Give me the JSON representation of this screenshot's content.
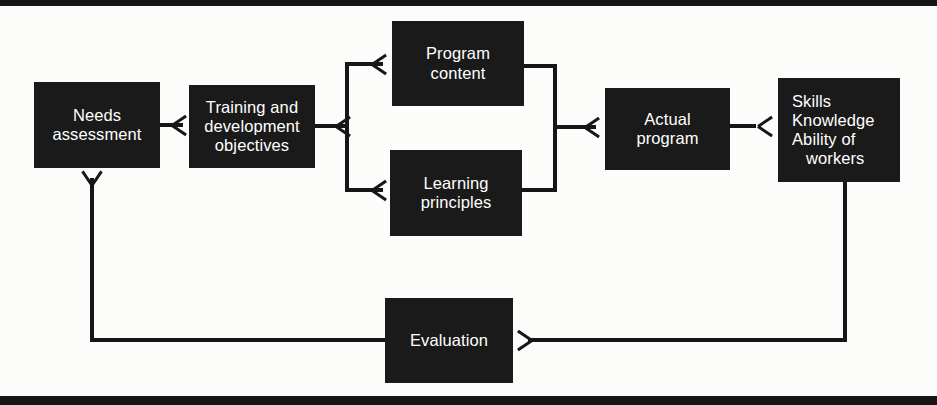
{
  "figure": {
    "background_color": "#fcfcfb",
    "node_fill_color": "#1a1a1a",
    "node_text_color": "#ffffff",
    "connector_color": "#161616"
  },
  "rules": {
    "top_label": "top-rule",
    "bottom_label": "bottom-rule"
  },
  "nodes": {
    "needs_assessment": {
      "lines": [
        "Needs",
        "assessment"
      ]
    },
    "training_objectives": {
      "lines": [
        "Training and",
        "development",
        "objectives"
      ]
    },
    "program_content": {
      "lines": [
        "Program",
        "content"
      ]
    },
    "learning_principles": {
      "lines": [
        "Learning",
        "principles"
      ]
    },
    "actual_program": {
      "lines": [
        "Actual",
        "program"
      ]
    },
    "skills_knowledge": {
      "lines": [
        "Skills",
        "Knowledge",
        "Ability of",
        "workers"
      ]
    },
    "evaluation": {
      "lines": [
        "Evaluation"
      ]
    }
  },
  "connectors": [
    {
      "name": "needs-to-training",
      "from": "needs_assessment",
      "to": "training_objectives",
      "arrow": "right"
    },
    {
      "name": "training-to-split",
      "from": "training_objectives",
      "to": "split-junction",
      "arrow": "right"
    },
    {
      "name": "split-to-program-content",
      "from": "split-junction",
      "to": "program_content",
      "arrow": "right"
    },
    {
      "name": "split-to-learning-principles",
      "from": "split-junction",
      "to": "learning_principles",
      "arrow": "right"
    },
    {
      "name": "program-content-to-merge",
      "from": "program_content",
      "to": "merge-junction",
      "arrow": "none"
    },
    {
      "name": "learning-principles-to-merge",
      "from": "learning_principles",
      "to": "merge-junction",
      "arrow": "none"
    },
    {
      "name": "merge-to-actual-program",
      "from": "merge-junction",
      "to": "actual_program",
      "arrow": "right"
    },
    {
      "name": "actual-program-to-skills",
      "from": "actual_program",
      "to": "skills_knowledge",
      "arrow": "right"
    },
    {
      "name": "skills-to-evaluation",
      "from": "skills_knowledge",
      "to": "evaluation",
      "arrow": "left"
    },
    {
      "name": "evaluation-to-needs-feedback",
      "from": "evaluation",
      "to": "needs_assessment",
      "arrow": "up"
    }
  ]
}
